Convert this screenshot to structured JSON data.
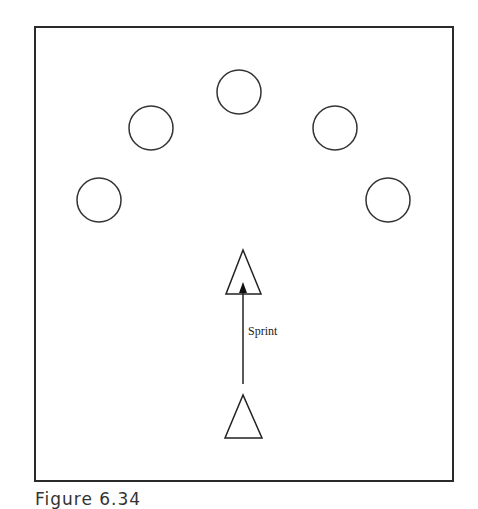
{
  "figure": {
    "caption": "Figure 6.34",
    "frame": {
      "x": 35,
      "y": 27,
      "width": 418,
      "height": 454,
      "stroke": "#2a2a2a"
    },
    "cones": [
      {
        "name": "cone-top",
        "cx": 239,
        "cy": 92,
        "r": 22
      },
      {
        "name": "cone-upper-left",
        "cx": 151,
        "cy": 128,
        "r": 22
      },
      {
        "name": "cone-upper-right",
        "cx": 335,
        "cy": 128,
        "r": 22
      },
      {
        "name": "cone-lower-left",
        "cx": 99,
        "cy": 200,
        "r": 22
      },
      {
        "name": "cone-lower-right",
        "cx": 388,
        "cy": 200,
        "r": 22
      }
    ],
    "players": [
      {
        "name": "player-end",
        "points": "243,250 226,294 261,294"
      },
      {
        "name": "player-start",
        "points": "243,395 225,438 262,438"
      }
    ],
    "arrow": {
      "x": 243,
      "y1": 384,
      "y2": 282,
      "label": "Sprint",
      "label_x": 248,
      "label_y": 335
    }
  }
}
